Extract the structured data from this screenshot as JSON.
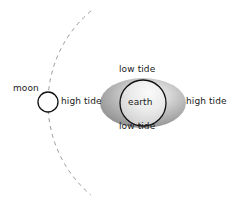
{
  "diagram": {
    "background_color": "#ffffff",
    "labels": {
      "moon": "moon",
      "earth": "earth",
      "high_tide_left": "high tide",
      "high_tide_right": "high tide",
      "low_tide_top": "low tide",
      "low_tide_bottom": "low tide"
    },
    "colors": {
      "text": "#1a1a1a",
      "orbit_dash": "#9a9aa0",
      "bulge_dark": "#8d8d8d",
      "bulge_mid": "#b5b5b5",
      "bulge_light": "#e8e8e8",
      "earth_fill_light": "#f2f2f2",
      "earth_fill_dark": "#cfcfcf",
      "earth_stroke": "#111111",
      "moon_fill": "#ffffff",
      "moon_stroke": "#111111"
    },
    "geometry": {
      "moon_center_x": 48,
      "moon_center_y": 102,
      "moon_radius": 10,
      "earth_center_x": 143,
      "earth_center_y": 103,
      "earth_radius": 23,
      "bulge_center_x": 143,
      "bulge_center_y": 103,
      "bulge_rx": 43,
      "bulge_ry": 25,
      "orbit_center_x": 168,
      "orbit_center_y": 103,
      "orbit_radius": 120,
      "orbit_dash_pattern": "4 4"
    }
  }
}
